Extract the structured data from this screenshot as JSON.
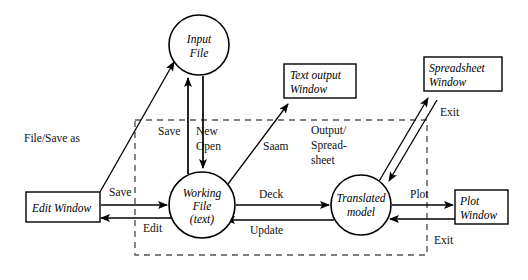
{
  "diagram": {
    "type": "data-flow-diagram",
    "background_color": "#ffffff",
    "stroke_color": "#000000",
    "boundary_color": "#555555",
    "boundary": {
      "name": "application-boundary",
      "style": "dashed-rectangle",
      "x": 135,
      "y": 120,
      "width": 292,
      "height": 135
    },
    "nodes": [
      {
        "id": "input-file",
        "shape": "circle",
        "lines": [
          "Input",
          "File"
        ],
        "cx": 199,
        "cy": 45,
        "r": 30
      },
      {
        "id": "working-file",
        "shape": "circle",
        "lines": [
          "Working",
          "File",
          "(text)"
        ],
        "cx": 202,
        "cy": 205,
        "r": 33
      },
      {
        "id": "translated-model",
        "shape": "circle",
        "lines": [
          "Translated",
          "model"
        ],
        "cx": 361,
        "cy": 205,
        "r": 30
      },
      {
        "id": "edit-window",
        "shape": "rectangle",
        "lines": [
          "Edit Window"
        ],
        "x": 26,
        "y": 192,
        "width": 74,
        "height": 30
      },
      {
        "id": "text-output-window",
        "shape": "rectangle",
        "lines": [
          "Text output",
          "Window"
        ],
        "x": 284,
        "y": 64,
        "width": 72,
        "height": 34
      },
      {
        "id": "spreadsheet-window",
        "shape": "rectangle",
        "lines": [
          "Spreadsheet",
          "Window"
        ],
        "x": 424,
        "y": 57,
        "width": 78,
        "height": 34
      },
      {
        "id": "plot-window",
        "shape": "rectangle",
        "lines": [
          "Plot",
          "Window"
        ],
        "x": 455,
        "y": 190,
        "width": 53,
        "height": 34
      }
    ],
    "edge_labels": [
      {
        "id": "file-save-as",
        "text": "File/Save as",
        "x": 24,
        "y": 142
      },
      {
        "id": "save-upper",
        "text": "Save",
        "x": 158,
        "y": 135
      },
      {
        "id": "new",
        "text": "New",
        "x": 196,
        "y": 135
      },
      {
        "id": "open",
        "text": "Open",
        "x": 196,
        "y": 150
      },
      {
        "id": "saam",
        "text": "Saam",
        "x": 263,
        "y": 150
      },
      {
        "id": "output",
        "text": "Output/",
        "x": 311,
        "y": 134
      },
      {
        "id": "spread",
        "text": "Spread-",
        "x": 311,
        "y": 149
      },
      {
        "id": "sheet",
        "text": "sheet",
        "x": 311,
        "y": 164
      },
      {
        "id": "exit-top",
        "text": "Exit",
        "x": 440,
        "y": 116
      },
      {
        "id": "save-lower",
        "text": "Save",
        "x": 109,
        "y": 196
      },
      {
        "id": "edit",
        "text": "Edit",
        "x": 143,
        "y": 226
      },
      {
        "id": "deck",
        "text": "Deck",
        "x": 259,
        "y": 196
      },
      {
        "id": "update",
        "text": "Update",
        "x": 250,
        "y": 230
      },
      {
        "id": "plot",
        "text": "Plot",
        "x": 410,
        "y": 196
      },
      {
        "id": "exit-bottom",
        "text": "Exit",
        "x": 434,
        "y": 240
      }
    ]
  }
}
